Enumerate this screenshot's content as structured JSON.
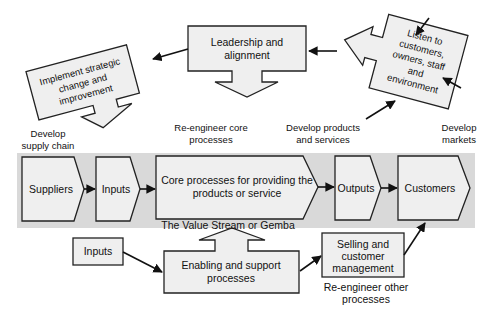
{
  "diagram": {
    "top": {
      "leadership": [
        "Leadership and",
        "alignment"
      ],
      "implement": [
        "Implement strategic",
        "change and",
        "improvement"
      ],
      "listen": [
        "Listen to",
        "customers,",
        "owners, staff",
        "and",
        "environment"
      ]
    },
    "captions": {
      "develop_supply_chain": [
        "Develop",
        "supply chain"
      ],
      "reengineer_core": [
        "Re-engineer core",
        "processes"
      ],
      "develop_products": [
        "Develop products",
        "and services"
      ],
      "develop_markets": [
        "Develop",
        "markets"
      ],
      "value_stream": "The Value Stream or Gemba",
      "reengineer_other": [
        "Re-engineer other",
        "processes"
      ]
    },
    "value_chain": {
      "suppliers": "Suppliers",
      "inputs": "Inputs",
      "core": [
        "Core processes for providing the",
        "products or service"
      ],
      "outputs": "Outputs",
      "customers": "Customers"
    },
    "bottom": {
      "inputs": "Inputs",
      "enabling": [
        "Enabling and support",
        "processes"
      ],
      "selling": [
        "Selling and",
        "customer",
        "management"
      ]
    },
    "colors": {
      "band": "#d9d9d9",
      "box_fill": "#efefef",
      "stroke": "#222222"
    }
  }
}
